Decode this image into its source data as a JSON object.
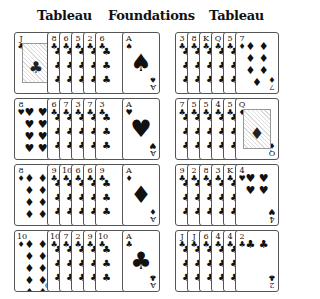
{
  "headers": {
    "left": "Tableau",
    "center": "Foundations",
    "right": "Tableau"
  },
  "layout": {
    "row_tops": [
      32,
      98,
      164,
      230
    ],
    "left_start_x": 14,
    "left_step": 12,
    "found_x": 122,
    "right_start_x": 175,
    "right_step": 12
  },
  "left_tableau": [
    {
      "cards": [
        {
          "rank": "J",
          "suit": "♣",
          "face": true
        },
        {
          "rank": "8",
          "suit": "♣"
        },
        {
          "rank": "6",
          "suit": "♣"
        },
        {
          "rank": "5",
          "suit": "♣"
        },
        {
          "rank": "2",
          "suit": "♣"
        },
        {
          "rank": "6",
          "suit": "♣"
        }
      ]
    },
    {
      "cards": [
        {
          "rank": "8",
          "suit": "♥"
        },
        {
          "rank": "6",
          "suit": "♣"
        },
        {
          "rank": "7",
          "suit": "♣"
        },
        {
          "rank": "3",
          "suit": "♣"
        },
        {
          "rank": "7",
          "suit": "♣"
        },
        {
          "rank": "3",
          "suit": "♣"
        }
      ]
    },
    {
      "cards": [
        {
          "rank": "8",
          "suit": "♦"
        },
        {
          "rank": "9",
          "suit": "♣"
        },
        {
          "rank": "10",
          "suit": "♣"
        },
        {
          "rank": "6",
          "suit": "♣"
        },
        {
          "rank": "6",
          "suit": "♣"
        },
        {
          "rank": "9",
          "suit": "♣"
        }
      ]
    },
    {
      "cards": [
        {
          "rank": "10",
          "suit": "♦"
        },
        {
          "rank": "10",
          "suit": "♣"
        },
        {
          "rank": "7",
          "suit": "♣"
        },
        {
          "rank": "2",
          "suit": "♣"
        },
        {
          "rank": "9",
          "suit": "♣"
        },
        {
          "rank": "10",
          "suit": "♣"
        }
      ]
    }
  ],
  "foundations": [
    {
      "rank": "A",
      "suit": "♠"
    },
    {
      "rank": "A",
      "suit": "♥"
    },
    {
      "rank": "A",
      "suit": "♦"
    },
    {
      "rank": "A",
      "suit": "♣"
    }
  ],
  "right_tableau": [
    {
      "cards": [
        {
          "rank": "3",
          "suit": "♣"
        },
        {
          "rank": "8",
          "suit": "♣"
        },
        {
          "rank": "K",
          "suit": "♣"
        },
        {
          "rank": "Q",
          "suit": "♣"
        },
        {
          "rank": "5",
          "suit": "♣"
        },
        {
          "rank": "7",
          "suit": "♦"
        }
      ]
    },
    {
      "cards": [
        {
          "rank": "7",
          "suit": "♣"
        },
        {
          "rank": "5",
          "suit": "♣"
        },
        {
          "rank": "5",
          "suit": "♣"
        },
        {
          "rank": "4",
          "suit": "♣"
        },
        {
          "rank": "5",
          "suit": "♣"
        },
        {
          "rank": "Q",
          "suit": "♦",
          "face": true
        }
      ]
    },
    {
      "cards": [
        {
          "rank": "9",
          "suit": "♣"
        },
        {
          "rank": "2",
          "suit": "♣"
        },
        {
          "rank": "8",
          "suit": "♣"
        },
        {
          "rank": "3",
          "suit": "♣"
        },
        {
          "rank": "K",
          "suit": "♣"
        },
        {
          "rank": "4",
          "suit": "♥"
        }
      ]
    },
    {
      "cards": [
        {
          "rank": "J",
          "suit": "♣"
        },
        {
          "rank": "J",
          "suit": "♣"
        },
        {
          "rank": "6",
          "suit": "♣"
        },
        {
          "rank": "4",
          "suit": "♣"
        },
        {
          "rank": "4",
          "suit": "♣"
        },
        {
          "rank": "2",
          "suit": "♣"
        }
      ]
    }
  ]
}
